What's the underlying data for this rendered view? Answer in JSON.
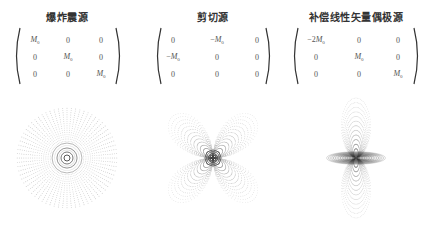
{
  "panels": [
    {
      "title": "爆炸震源",
      "matrix": [
        [
          "M0",
          "0",
          "0"
        ],
        [
          "0",
          "M0",
          "0"
        ],
        [
          "0",
          "0",
          "M0"
        ]
      ],
      "pattern": "explosion-radial"
    },
    {
      "title": "剪切源",
      "matrix": [
        [
          "0",
          "-M0",
          "0"
        ],
        [
          "-M0",
          "0",
          "0"
        ],
        [
          "0",
          "0",
          "0"
        ]
      ],
      "pattern": "shear-double-couple-quadrant"
    },
    {
      "title": "补偿线性矢量偶极源",
      "matrix": [
        [
          "-2M0",
          "0",
          "0"
        ],
        [
          "0",
          "M0",
          "0"
        ],
        [
          "0",
          "0",
          "M0"
        ]
      ],
      "pattern": "clvd-bipolar"
    }
  ],
  "colors": {
    "ink": "#333333",
    "dots": "#888888",
    "dense": "#222222"
  }
}
